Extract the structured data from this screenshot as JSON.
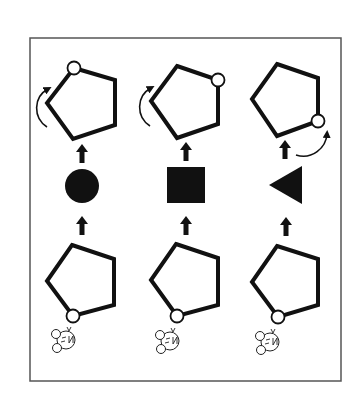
{
  "diagram": {
    "colors": {
      "stroke": "#111111",
      "fill_shape": "#111111",
      "frame": "#555555",
      "background": "#ffffff",
      "vertex_marker_fill": "#ffffff"
    },
    "columns": [
      {
        "id": "column-1",
        "middle_shape": "circle",
        "top_marker_vertex": "top",
        "rotation_arrow": "left-side counterclockwise",
        "bottom_marker_vertex": "bottom",
        "creature": "mouse-face"
      },
      {
        "id": "column-2",
        "middle_shape": "square",
        "top_marker_vertex": "upper-right",
        "rotation_arrow": "left-side counterclockwise",
        "bottom_marker_vertex": "bottom",
        "creature": "mouse-face"
      },
      {
        "id": "column-3",
        "middle_shape": "left-pointing triangle",
        "top_marker_vertex": "lower-right",
        "rotation_arrow": "bottom-right clockwise",
        "bottom_marker_vertex": "bottom",
        "creature": "mouse-face"
      }
    ]
  }
}
